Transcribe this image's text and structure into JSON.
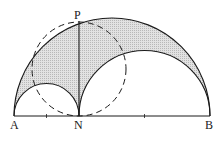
{
  "diagram": {
    "type": "geometry-arbelos",
    "points": {
      "A": {
        "label": "A",
        "x": 14,
        "y": 116
      },
      "N": {
        "label": "N",
        "x": 79,
        "y": 116
      },
      "B": {
        "label": "B",
        "x": 210,
        "y": 116
      },
      "P": {
        "label": "P",
        "x": 79,
        "y": 22
      }
    },
    "shapes": [
      {
        "name": "large-semicircle",
        "diameter": "AB"
      },
      {
        "name": "small-semicircle",
        "diameter": "AN"
      },
      {
        "name": "medium-semicircle",
        "diameter": "NB"
      },
      {
        "name": "dashed-circle",
        "diameter": "PN",
        "style": "dashed"
      },
      {
        "name": "segment-PN",
        "from": "P",
        "to": "N"
      }
    ],
    "ticks_at_x": [
      46,
      144
    ],
    "colors": {
      "stroke": "#1a1a1a",
      "shade": "#d4d4d4"
    }
  }
}
